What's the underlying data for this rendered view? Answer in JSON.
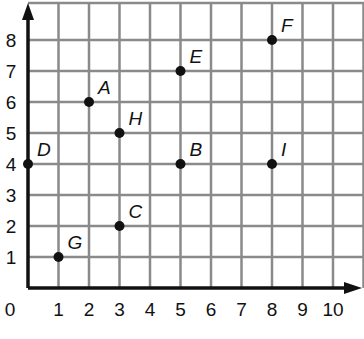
{
  "chart_data": {
    "type": "scatter",
    "title": "",
    "xlabel": "",
    "ylabel": "",
    "xlim": [
      0,
      11
    ],
    "ylim": [
      0,
      9
    ],
    "grid": true,
    "x_ticks": [
      "0",
      "1",
      "2",
      "3",
      "4",
      "5",
      "6",
      "7",
      "8",
      "9",
      "10"
    ],
    "y_ticks": [
      "1",
      "2",
      "3",
      "4",
      "5",
      "6",
      "7",
      "8"
    ],
    "points": [
      {
        "label": "A",
        "x": 2,
        "y": 6
      },
      {
        "label": "B",
        "x": 5,
        "y": 4
      },
      {
        "label": "C",
        "x": 3,
        "y": 2
      },
      {
        "label": "D",
        "x": 0,
        "y": 4
      },
      {
        "label": "E",
        "x": 5,
        "y": 7
      },
      {
        "label": "F",
        "x": 8,
        "y": 8
      },
      {
        "label": "G",
        "x": 1,
        "y": 1
      },
      {
        "label": "H",
        "x": 3,
        "y": 5
      },
      {
        "label": "I",
        "x": 8,
        "y": 4
      }
    ]
  },
  "colors": {
    "grid": "#8a8a8a",
    "axis": "#111111",
    "point": "#111111"
  }
}
